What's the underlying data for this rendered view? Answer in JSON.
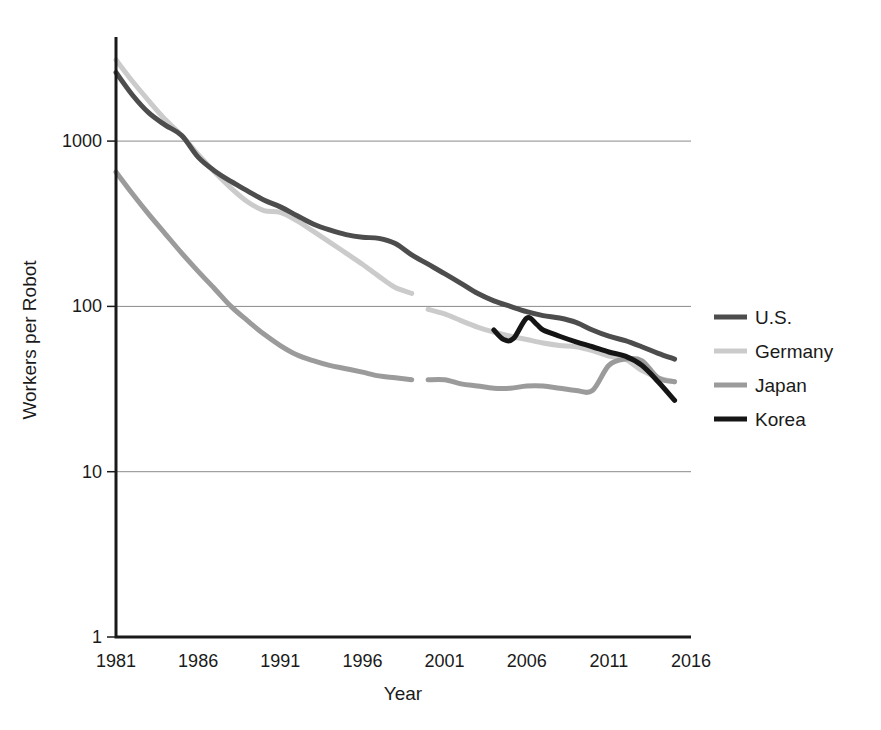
{
  "chart_data": {
    "type": "line",
    "title": "",
    "xlabel": "Year",
    "ylabel": "Workers per Robot",
    "yscale": "log",
    "ylim": [
      1,
      4000
    ],
    "xlim": [
      1981,
      2016
    ],
    "grid": "horizontal",
    "legend_position": "right",
    "y_ticks": [
      "1",
      "10",
      "100",
      "1000"
    ],
    "y_tick_values": [
      1,
      10,
      100,
      1000
    ],
    "x_ticks": [
      "1981",
      "1986",
      "1991",
      "1996",
      "2001",
      "2006",
      "2011",
      "2016"
    ],
    "x_tick_values": [
      1981,
      1986,
      1991,
      1996,
      2001,
      2006,
      2011,
      2016
    ],
    "series": [
      {
        "name": "U.S.",
        "color": "#4d4d4d",
        "width": 5,
        "points": [
          [
            1981,
            2600
          ],
          [
            1982,
            1900
          ],
          [
            1983,
            1480
          ],
          [
            1984,
            1250
          ],
          [
            1985,
            1080
          ],
          [
            1986,
            800
          ],
          [
            1987,
            660
          ],
          [
            1988,
            570
          ],
          [
            1989,
            500
          ],
          [
            1990,
            440
          ],
          [
            1991,
            400
          ],
          [
            1992,
            355
          ],
          [
            1993,
            315
          ],
          [
            1994,
            290
          ],
          [
            1995,
            272
          ],
          [
            1996,
            262
          ],
          [
            1997,
            258
          ],
          [
            1998,
            240
          ],
          [
            1999,
            205
          ],
          [
            2000,
            180
          ],
          [
            2001,
            158
          ],
          [
            2002,
            138
          ],
          [
            2003,
            120
          ],
          [
            2004,
            108
          ],
          [
            2005,
            100
          ],
          [
            2006,
            93
          ],
          [
            2007,
            88
          ],
          [
            2008,
            85
          ],
          [
            2009,
            80
          ],
          [
            2010,
            72
          ],
          [
            2011,
            66
          ],
          [
            2012,
            62
          ],
          [
            2013,
            57
          ],
          [
            2014,
            52
          ],
          [
            2015,
            48
          ]
        ]
      },
      {
        "name": "Germany",
        "color": "#cbcbcb",
        "width": 5,
        "segments": [
          {
            "points": [
              [
                1981,
                3100
              ],
              [
                1982,
                2300
              ],
              [
                1983,
                1750
              ],
              [
                1984,
                1350
              ],
              [
                1985,
                1080
              ],
              [
                1986,
                830
              ],
              [
                1987,
                650
              ],
              [
                1988,
                520
              ],
              [
                1989,
                430
              ],
              [
                1990,
                380
              ],
              [
                1991,
                370
              ],
              [
                1992,
                330
              ],
              [
                1993,
                285
              ],
              [
                1994,
                245
              ],
              [
                1995,
                210
              ],
              [
                1996,
                180
              ],
              [
                1997,
                152
              ],
              [
                1998,
                130
              ],
              [
                1999,
                120
              ]
            ]
          },
          {
            "points": [
              [
                2000,
                96
              ],
              [
                2001,
                90
              ],
              [
                2002,
                82
              ],
              [
                2003,
                75
              ],
              [
                2004,
                70
              ],
              [
                2005,
                66
              ],
              [
                2006,
                63
              ],
              [
                2007,
                60
              ],
              [
                2008,
                58
              ],
              [
                2009,
                57
              ],
              [
                2010,
                54
              ],
              [
                2011,
                50
              ],
              [
                2012,
                48
              ],
              [
                2013,
                41
              ],
              [
                2014,
                37
              ],
              [
                2015,
                35
              ]
            ]
          }
        ]
      },
      {
        "name": "Japan",
        "color": "#9b9b9b",
        "width": 5,
        "segments": [
          {
            "points": [
              [
                1981,
                650
              ],
              [
                1982,
                480
              ],
              [
                1983,
                360
              ],
              [
                1984,
                275
              ],
              [
                1985,
                210
              ],
              [
                1986,
                163
              ],
              [
                1987,
                128
              ],
              [
                1988,
                100
              ],
              [
                1989,
                82
              ],
              [
                1990,
                68
              ],
              [
                1991,
                58
              ],
              [
                1992,
                51
              ],
              [
                1993,
                47
              ],
              [
                1994,
                44
              ],
              [
                1995,
                42
              ],
              [
                1996,
                40
              ],
              [
                1997,
                38
              ],
              [
                1998,
                37
              ],
              [
                1999,
                36
              ]
            ]
          },
          {
            "points": [
              [
                2000,
                36
              ],
              [
                2001,
                36
              ],
              [
                2002,
                34
              ],
              [
                2003,
                33
              ],
              [
                2004,
                32
              ],
              [
                2005,
                32
              ],
              [
                2006,
                33
              ],
              [
                2007,
                33
              ],
              [
                2008,
                32
              ],
              [
                2009,
                31
              ],
              [
                2010,
                31
              ],
              [
                2011,
                44
              ],
              [
                2012,
                48
              ],
              [
                2013,
                47
              ],
              [
                2014,
                37
              ],
              [
                2015,
                35
              ]
            ]
          }
        ]
      },
      {
        "name": "Korea",
        "color": "#151515",
        "width": 5,
        "points": [
          [
            2004,
            72
          ],
          [
            2004.6,
            63
          ],
          [
            2005.2,
            64
          ],
          [
            2006,
            85
          ],
          [
            2006.6,
            78
          ],
          [
            2007,
            72
          ],
          [
            2008,
            66
          ],
          [
            2009,
            61
          ],
          [
            2010,
            57
          ],
          [
            2011,
            53
          ],
          [
            2012,
            50
          ],
          [
            2013,
            44
          ],
          [
            2014,
            35
          ],
          [
            2015,
            27
          ]
        ]
      }
    ]
  },
  "legend": {
    "entries": [
      {
        "label": "U.S.",
        "color": "#4d4d4d"
      },
      {
        "label": "Germany",
        "color": "#cbcbcb"
      },
      {
        "label": "Japan",
        "color": "#9b9b9b"
      },
      {
        "label": "Korea",
        "color": "#151515"
      }
    ]
  },
  "axes": {
    "x_title": "Year",
    "y_title": "Workers per Robot"
  },
  "colors": {
    "gridline": "#8a8a8a",
    "axis": "#1a1a1a",
    "text": "#1a1a1a",
    "background": "#ffffff"
  }
}
